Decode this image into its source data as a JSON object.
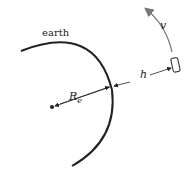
{
  "diagram": {
    "labels": {
      "earth": "earth",
      "radius_main": "R",
      "radius_sub": "e",
      "height": "h",
      "velocity": "v"
    },
    "colors": {
      "stroke": "#222222",
      "velocity_arrow": "#777777"
    }
  }
}
